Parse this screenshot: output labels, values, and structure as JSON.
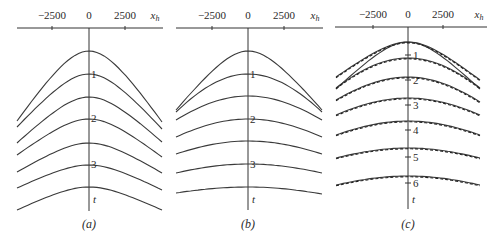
{
  "figure": {
    "panels": [
      {
        "id": "a",
        "caption": "(a)",
        "x_axis": {
          "variable": "x_h",
          "variable_main": "x",
          "variable_sub": "h",
          "ticks": [
            {
              "value": -2500,
              "label": "−2500",
              "px": 52
            },
            {
              "value": 0,
              "label": "0",
              "px": 89
            },
            {
              "value": 2500,
              "label": "2500",
              "px": 125
            }
          ],
          "line": {
            "x1": 17,
            "x2": 163,
            "y": 28
          }
        },
        "t_axis": {
          "label": "t",
          "x": 89,
          "y1": 28,
          "y2": 211,
          "label_y": 203,
          "ticks": []
        },
        "curve_labels": [
          {
            "text": "1",
            "y": 78
          },
          {
            "text": "2",
            "y": 122
          },
          {
            "text": "3",
            "y": 168
          }
        ],
        "curves": [
          {
            "apex_y": 51,
            "left_y": 121,
            "right_y": 122,
            "shape": "sharp",
            "dashed": false
          },
          {
            "apex_y": 74,
            "left_y": 127,
            "right_y": 129,
            "shape": "sharp",
            "dashed": false
          },
          {
            "apex_y": 97,
            "left_y": 143,
            "right_y": 142,
            "shape": "sharp",
            "dashed": false
          },
          {
            "apex_y": 119,
            "left_y": 155,
            "right_y": 157,
            "shape": "sharp",
            "dashed": false
          },
          {
            "apex_y": 143,
            "left_y": 172,
            "right_y": 173,
            "shape": "sharp",
            "dashed": false
          },
          {
            "apex_y": 165,
            "left_y": 188,
            "right_y": 190,
            "shape": "sharp",
            "dashed": false
          },
          {
            "apex_y": 187,
            "left_y": 210,
            "right_y": 210,
            "shape": "sharp",
            "dashed": false
          }
        ],
        "x_left": 17,
        "x_right": 162,
        "caption_y": 228
      },
      {
        "id": "b",
        "caption": "(b)",
        "x_axis": {
          "variable": "x_h",
          "variable_main": "x",
          "variable_sub": "h",
          "ticks": [
            {
              "value": -2500,
              "label": "−2500",
              "px": 212
            },
            {
              "value": 0,
              "label": "0",
              "px": 248
            },
            {
              "value": 2500,
              "label": "2500",
              "px": 284
            }
          ],
          "line": {
            "x1": 176,
            "x2": 323,
            "y": 28
          }
        },
        "t_axis": {
          "label": "t",
          "x": 248,
          "y1": 28,
          "y2": 210,
          "label_y": 203,
          "ticks": []
        },
        "curve_labels": [
          {
            "text": "1",
            "y": 78
          },
          {
            "text": "2",
            "y": 123
          },
          {
            "text": "3",
            "y": 168
          }
        ],
        "curves": [
          {
            "apex_y": 51,
            "left_y": 110,
            "right_y": 110,
            "shape": "sharp",
            "dashed": false
          },
          {
            "apex_y": 74,
            "left_y": 112,
            "right_y": 112,
            "shape": "round",
            "dashed": false
          },
          {
            "apex_y": 96,
            "left_y": 120,
            "right_y": 120,
            "shape": "round",
            "dashed": false
          },
          {
            "apex_y": 119,
            "left_y": 137,
            "right_y": 137,
            "shape": "round",
            "dashed": false
          },
          {
            "apex_y": 141,
            "left_y": 154,
            "right_y": 154,
            "shape": "round",
            "dashed": false
          },
          {
            "apex_y": 164,
            "left_y": 173,
            "right_y": 173,
            "shape": "round",
            "dashed": false
          },
          {
            "apex_y": 187,
            "left_y": 193,
            "right_y": 194,
            "shape": "round",
            "dashed": false
          }
        ],
        "x_left": 176,
        "x_right": 322,
        "caption_y": 228
      },
      {
        "id": "c",
        "caption": "(c)",
        "x_axis": {
          "variable": "x_h",
          "variable_main": "x",
          "variable_sub": "h",
          "ticks": [
            {
              "value": -2500,
              "label": "−2500",
              "px": 373
            },
            {
              "value": 0,
              "label": "0",
              "px": 408
            },
            {
              "value": 2500,
              "label": "2500",
              "px": 443
            }
          ],
          "line": {
            "x1": 335,
            "x2": 487,
            "y": 27
          }
        },
        "t_axis": {
          "label": "t",
          "x": 408,
          "y1": 27,
          "y2": 209,
          "label_y": 203,
          "ticks": [
            {
              "label": "1",
              "y": 55
            },
            {
              "label": "2",
              "y": 80
            },
            {
              "label": "3",
              "y": 105
            },
            {
              "label": "4",
              "y": 130
            },
            {
              "label": "5",
              "y": 157
            },
            {
              "label": "6",
              "y": 183
            }
          ]
        },
        "curve_labels": [],
        "curves": [
          {
            "apex_y": 42,
            "left_y": 89,
            "right_y": 89,
            "shape": "sharp",
            "dashed": false
          },
          {
            "apex_y": 42,
            "left_y": 77,
            "right_y": 80,
            "shape": "sharp",
            "dashed": true
          },
          {
            "apex_y": 58,
            "left_y": 88,
            "right_y": 88,
            "shape": "round",
            "dashed": true
          },
          {
            "apex_y": 77,
            "left_y": 100,
            "right_y": 102,
            "shape": "round",
            "dashed": true
          },
          {
            "apex_y": 98,
            "left_y": 115,
            "right_y": 115,
            "shape": "round",
            "dashed": true
          },
          {
            "apex_y": 121,
            "left_y": 135,
            "right_y": 135,
            "shape": "round",
            "dashed": true
          },
          {
            "apex_y": 148,
            "left_y": 158,
            "right_y": 158,
            "shape": "round",
            "dashed": true
          },
          {
            "apex_y": 176,
            "left_y": 185,
            "right_y": 185,
            "shape": "round",
            "dashed": true
          }
        ],
        "x_left": 336,
        "x_right": 480,
        "caption_y": 228
      }
    ]
  }
}
